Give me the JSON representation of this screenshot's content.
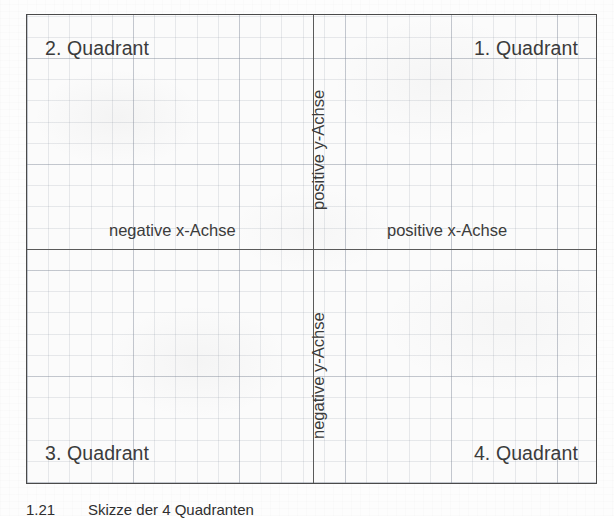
{
  "figure": {
    "quadrants": [
      {
        "id": "quadrant-2",
        "label": "2. Quadrant"
      },
      {
        "id": "quadrant-1",
        "label": "1. Quadrant"
      },
      {
        "id": "quadrant-3",
        "label": "3. Quadrant"
      },
      {
        "id": "quadrant-4",
        "label": "4. Quadrant"
      }
    ],
    "axis_labels": {
      "negative_x": "negative x-Achse",
      "positive_x": "positive x-Achse",
      "positive_y": "positive y-Achse",
      "negative_y": "negative y-Achse"
    },
    "colors": {
      "frame": "#4a4a4a",
      "axis": "#5a5a5a",
      "grid": "#7d8796",
      "text": "#3b3b3b",
      "paper": "#fbfbfb"
    }
  },
  "caption": {
    "number": "1.21",
    "text": "Skizze der 4 Quadranten"
  }
}
